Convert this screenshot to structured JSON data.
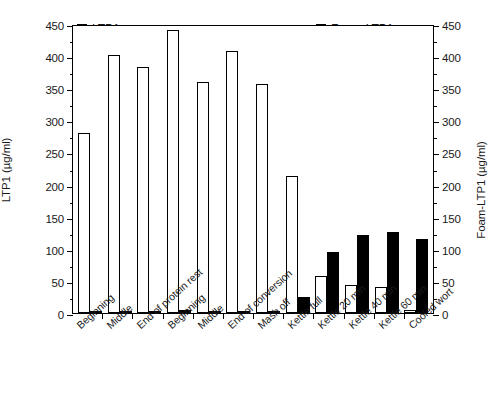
{
  "chart_data": {
    "type": "bar",
    "title": "",
    "xlabel": "",
    "ylabel": "LTP1  (µg/ml)",
    "y2label": "Foam-LTP1  (µg/ml)",
    "ylim": [
      0,
      450
    ],
    "y2lim": [
      0,
      450
    ],
    "yticks": [
      0,
      50,
      100,
      150,
      200,
      250,
      300,
      350,
      400,
      450
    ],
    "y2ticks": [
      0,
      50,
      100,
      150,
      200,
      250,
      300,
      350,
      400,
      450
    ],
    "ytick_labels": [
      "0",
      "50",
      "100",
      "150",
      "200",
      "250",
      "300",
      "350",
      "400",
      "450"
    ],
    "y2tick_labels": [
      "0",
      "50",
      "100",
      "150",
      "200",
      "250",
      "300",
      "350",
      "400",
      "450"
    ],
    "grid": false,
    "legend_position": "top",
    "categories": [
      "Beginning",
      "Middle",
      "End of protein rest",
      "Beginning",
      "Middle",
      "End of conversion",
      "Mash off",
      "Kettle full",
      "Kettle 20 min",
      "Kettle 40 min",
      "Kettle 60 min",
      "Cooled wort"
    ],
    "series": [
      {
        "name": "LTP1",
        "style": "open",
        "color": "#ffffff",
        "edge_color": "#000000",
        "axis": "left",
        "values": [
          280,
          401,
          383,
          440,
          359,
          408,
          356,
          213,
          57,
          43,
          41,
          5
        ]
      },
      {
        "name": "Foam-LTP1",
        "style": "filled",
        "color": "#000000",
        "edge_color": "#000000",
        "axis": "right",
        "values": [
          2,
          3,
          3,
          4,
          2,
          2,
          2,
          25,
          95,
          121,
          126,
          116
        ]
      }
    ]
  },
  "legend": {
    "items": [
      {
        "label": "LTP1",
        "style": "open"
      },
      {
        "label": "Foam-LTP1",
        "style": "filled"
      }
    ]
  }
}
